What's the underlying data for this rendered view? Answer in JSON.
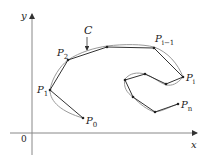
{
  "diagram": {
    "axes": {
      "x_label": "x",
      "y_label": "y",
      "origin_label": "0",
      "origin": [
        32,
        133
      ],
      "x_end": [
        197,
        133
      ],
      "y_end": [
        32,
        14
      ]
    },
    "curve_label": "C",
    "curve_color": "#9a9a9a",
    "polygon_color": "#333333",
    "axis_color": "#888888",
    "vertices": [
      {
        "x": 83,
        "y": 118,
        "label": "P",
        "sub": "0"
      },
      {
        "x": 50,
        "y": 90,
        "label": "P",
        "sub": "1"
      },
      {
        "x": 68,
        "y": 60,
        "label": "P",
        "sub": "2"
      },
      {
        "x": 107,
        "y": 47,
        "label": "",
        "sub": ""
      },
      {
        "x": 154,
        "y": 48,
        "label": "P",
        "sub": "i−1"
      },
      {
        "x": 183,
        "y": 77,
        "label": "P",
        "sub": "i"
      },
      {
        "x": 166,
        "y": 84,
        "label": "",
        "sub": ""
      },
      {
        "x": 145,
        "y": 74,
        "label": "",
        "sub": ""
      },
      {
        "x": 125,
        "y": 80,
        "label": "",
        "sub": ""
      },
      {
        "x": 133,
        "y": 97,
        "label": "",
        "sub": ""
      },
      {
        "x": 155,
        "y": 112,
        "label": "",
        "sub": ""
      },
      {
        "x": 178,
        "y": 104,
        "label": "P",
        "sub": "n"
      }
    ],
    "labels": {
      "P0": {
        "text": "P",
        "sub": "0"
      },
      "P1": {
        "text": "P",
        "sub": "1"
      },
      "P2": {
        "text": "P",
        "sub": "2"
      },
      "Pim1": {
        "text": "P",
        "sub": "i−1"
      },
      "Pi": {
        "text": "P",
        "sub": "i"
      },
      "Pn": {
        "text": "P",
        "sub": "n"
      }
    }
  }
}
